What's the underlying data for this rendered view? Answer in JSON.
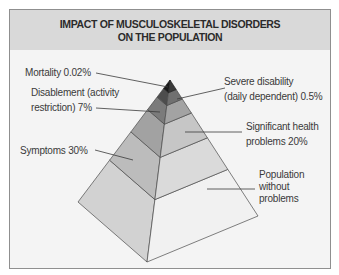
{
  "title": {
    "line1": "IMPACT OF MUSCULOSKELETAL DISORDERS",
    "line2": "ON THE POPULATION"
  },
  "colors": {
    "header_bg": "#d9d9d9",
    "panel_bg": "#f4f4f4",
    "edge": "#4a4a4a",
    "leader": "#3a3a3a"
  },
  "pyramid": {
    "layers": [
      {
        "name": "Mortality",
        "value": "0.02%",
        "label_lines": [
          "Mortality 0.02%"
        ],
        "left_color": "#1a1a1a",
        "right_color": "#3a3a3a"
      },
      {
        "name": "Severe disability (daily dependent)",
        "value": "0.5%",
        "label_lines": [
          "Severe disability",
          "(daily dependent) 0.5%"
        ],
        "left_color": "#4d4d4d",
        "right_color": "#707070"
      },
      {
        "name": "Disablement (activity restriction)",
        "value": "7%",
        "label_lines": [
          "Disablement (activity",
          "restriction) 7%"
        ],
        "left_color": "#7b7b7b",
        "right_color": "#a3a3a3"
      },
      {
        "name": "Significant health problems",
        "value": "20%",
        "label_lines": [
          "Significant health",
          "problems 20%"
        ],
        "left_color": "#a2a2a2",
        "right_color": "#c6c6c6"
      },
      {
        "name": "Symptoms",
        "value": "30%",
        "label_lines": [
          "Symptoms 30%"
        ],
        "left_color": "#bcbcbc",
        "right_color": "#dadada"
      },
      {
        "name": "Population without problems",
        "value": "",
        "label_lines": [
          "Population",
          "without",
          "problems"
        ],
        "left_color": "#d2d2d2",
        "right_color": "#f1f1f1"
      }
    ]
  }
}
